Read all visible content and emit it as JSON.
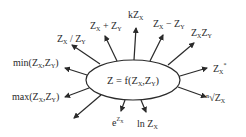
{
  "diagram": {
    "type": "radial",
    "center": {
      "label_main": "Z = f(Z",
      "label_sub1": "X",
      "label_mid": ",Z",
      "label_sub2": "Y",
      "label_end": ")"
    },
    "branches": [
      {
        "id": "ratio",
        "parts": [
          {
            "t": "Z"
          },
          {
            "t": "X",
            "sub": true
          },
          {
            "t": " / Z"
          },
          {
            "t": "Y",
            "sub": true
          }
        ]
      },
      {
        "id": "sum",
        "parts": [
          {
            "t": "Z"
          },
          {
            "t": "X",
            "sub": true
          },
          {
            "t": " + Z"
          },
          {
            "t": "Y",
            "sub": true
          }
        ]
      },
      {
        "id": "scale",
        "parts": [
          {
            "t": "kZ"
          },
          {
            "t": "X",
            "sub": true
          }
        ]
      },
      {
        "id": "difference",
        "parts": [
          {
            "t": "Z"
          },
          {
            "t": "X",
            "sub": true
          },
          {
            "t": " − Z"
          },
          {
            "t": "Y",
            "sub": true
          }
        ]
      },
      {
        "id": "product",
        "parts": [
          {
            "t": "Z"
          },
          {
            "t": "X",
            "sub": true
          },
          {
            "t": "Z"
          },
          {
            "t": "Y",
            "sub": true
          }
        ]
      },
      {
        "id": "power",
        "parts": [
          {
            "t": "Z"
          },
          {
            "t": "X",
            "sub": true
          },
          {
            "t": "*",
            "sup": true
          }
        ]
      },
      {
        "id": "root",
        "parts": [
          {
            "t": "ⁿ√"
          },
          {
            "t": "Z"
          },
          {
            "t": "X",
            "sub": true
          }
        ]
      },
      {
        "id": "log",
        "parts": [
          {
            "t": "ln Z"
          },
          {
            "t": "X",
            "sub": true
          }
        ]
      },
      {
        "id": "exp",
        "parts": [
          {
            "t": "e"
          },
          {
            "t": "Z",
            "sup": true
          },
          {
            "t": "X",
            "supsub": true
          }
        ]
      },
      {
        "id": "unlabeled",
        "parts": []
      },
      {
        "id": "max",
        "parts": [
          {
            "t": "max(Z"
          },
          {
            "t": "X",
            "sub": true
          },
          {
            "t": ",Z"
          },
          {
            "t": "Y",
            "sub": true
          },
          {
            "t": ")"
          }
        ]
      },
      {
        "id": "min",
        "parts": [
          {
            "t": "min(Z"
          },
          {
            "t": "X",
            "sub": true
          },
          {
            "t": ",Z"
          },
          {
            "t": "Y",
            "sub": true
          },
          {
            "t": ")"
          }
        ]
      }
    ]
  }
}
